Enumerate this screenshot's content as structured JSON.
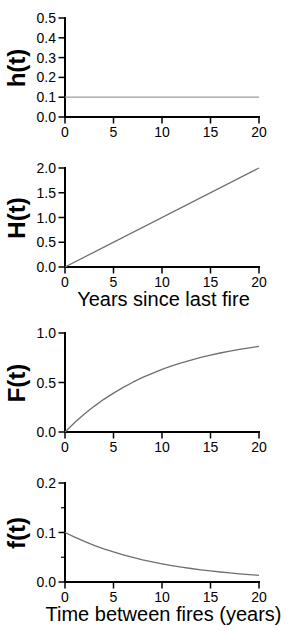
{
  "figure": {
    "background": "#ffffff",
    "axis_color": "#000000",
    "text_color": "#000000"
  },
  "chart_data": [
    {
      "id": "hazard-function",
      "type": "line",
      "ylabel": "h(t)",
      "xlabel": "",
      "xlim": [
        0,
        20
      ],
      "ylim": [
        0,
        0.5
      ],
      "xticks": [
        0,
        5,
        10,
        15,
        20
      ],
      "yticks": [
        0.0,
        0.1,
        0.2,
        0.3,
        0.4,
        0.5
      ],
      "yticks_minor": [],
      "line_color": "#9b9b9b",
      "series": [
        {
          "name": "h(t) constant hazard = 0.1",
          "points": [
            [
              0,
              0.1
            ],
            [
              20,
              0.1
            ]
          ]
        }
      ]
    },
    {
      "id": "cumulative-hazard",
      "type": "line",
      "ylabel": "H(t)",
      "xlabel": "Years since last fire",
      "xlim": [
        0,
        20
      ],
      "ylim": [
        0,
        2.0
      ],
      "xticks": [
        0,
        5,
        10,
        15,
        20
      ],
      "yticks": [
        0.0,
        0.5,
        1.0,
        1.5,
        2.0
      ],
      "yticks_minor": [],
      "line_color": "#6f6f6f",
      "series": [
        {
          "name": "H(t) = 0.1 t",
          "points": [
            [
              0,
              0
            ],
            [
              20,
              2.0
            ]
          ]
        }
      ]
    },
    {
      "id": "cumulative-distribution",
      "type": "line",
      "ylabel": "F(t)",
      "xlabel": "",
      "xlim": [
        0,
        20
      ],
      "ylim": [
        0,
        1.0
      ],
      "xticks": [
        0,
        5,
        10,
        15,
        20
      ],
      "yticks": [
        0.0,
        0.5,
        1.0
      ],
      "yticks_minor": [],
      "line_color": "#6f6f6f",
      "series": [
        {
          "name": "F(t) = 1 - exp(-0.1 t)",
          "points": [
            [
              0,
              0
            ],
            [
              1,
              0.095
            ],
            [
              2,
              0.181
            ],
            [
              3,
              0.259
            ],
            [
              4,
              0.33
            ],
            [
              5,
              0.393
            ],
            [
              6,
              0.451
            ],
            [
              7,
              0.503
            ],
            [
              8,
              0.551
            ],
            [
              9,
              0.593
            ],
            [
              10,
              0.632
            ],
            [
              11,
              0.667
            ],
            [
              12,
              0.699
            ],
            [
              13,
              0.727
            ],
            [
              14,
              0.753
            ],
            [
              15,
              0.777
            ],
            [
              16,
              0.798
            ],
            [
              17,
              0.817
            ],
            [
              18,
              0.835
            ],
            [
              19,
              0.85
            ],
            [
              20,
              0.865
            ]
          ]
        }
      ]
    },
    {
      "id": "probability-density",
      "type": "line",
      "ylabel": "f(t)",
      "xlabel": "Time between fires (years)",
      "xlim": [
        0,
        20
      ],
      "ylim": [
        0,
        0.2
      ],
      "xticks": [
        0,
        5,
        10,
        15,
        20
      ],
      "yticks": [
        0.0,
        0.1,
        0.2
      ],
      "yticks_minor": [
        0.05,
        0.15
      ],
      "line_color": "#6f6f6f",
      "series": [
        {
          "name": "f(t) = 0.1 exp(-0.1 t)",
          "points": [
            [
              0,
              0.1
            ],
            [
              1,
              0.0905
            ],
            [
              2,
              0.0819
            ],
            [
              3,
              0.0741
            ],
            [
              4,
              0.067
            ],
            [
              5,
              0.0607
            ],
            [
              6,
              0.0549
            ],
            [
              7,
              0.0497
            ],
            [
              8,
              0.0449
            ],
            [
              9,
              0.0407
            ],
            [
              10,
              0.0368
            ],
            [
              11,
              0.0333
            ],
            [
              12,
              0.0301
            ],
            [
              13,
              0.0273
            ],
            [
              14,
              0.0247
            ],
            [
              15,
              0.0223
            ],
            [
              16,
              0.0202
            ],
            [
              17,
              0.0183
            ],
            [
              18,
              0.0165
            ],
            [
              19,
              0.015
            ],
            [
              20,
              0.0135
            ]
          ]
        }
      ]
    }
  ]
}
